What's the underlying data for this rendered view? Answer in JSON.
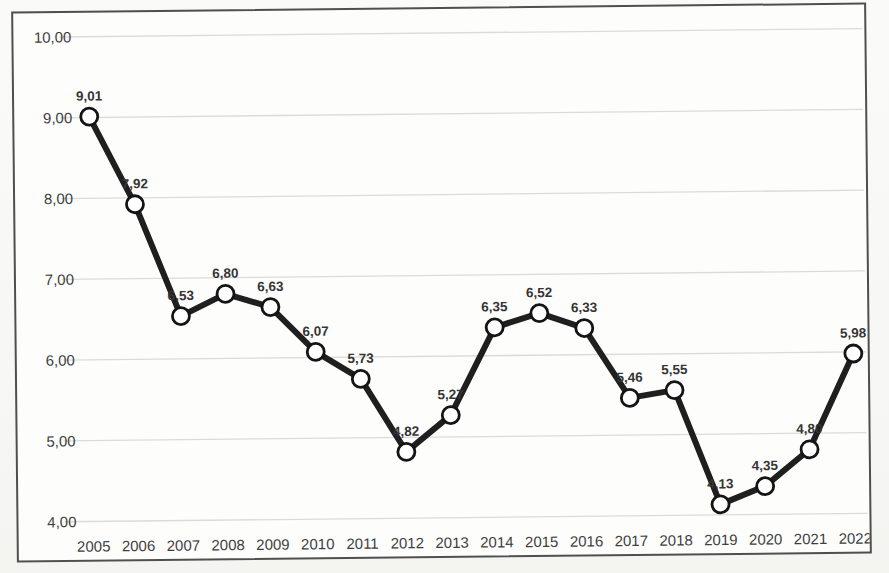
{
  "page": {
    "background": "#f8f8f6"
  },
  "chart_data": {
    "type": "line",
    "title": "",
    "xlabel": "",
    "ylabel": "",
    "legend": "none",
    "grid": "horizontal",
    "ylim": [
      4,
      10
    ],
    "categories": [
      "2005",
      "2006",
      "2007",
      "2008",
      "2009",
      "2010",
      "2011",
      "2012",
      "2013",
      "2014",
      "2015",
      "2016",
      "2017",
      "2018",
      "2019",
      "2020",
      "2021",
      "2022"
    ],
    "series": [
      {
        "name": "series-1",
        "values": [
          9.01,
          7.92,
          6.53,
          6.8,
          6.63,
          6.07,
          5.73,
          4.82,
          5.27,
          6.35,
          6.52,
          6.33,
          5.46,
          5.55,
          4.13,
          4.35,
          4.8,
          5.98
        ],
        "value_labels": [
          "9,01",
          "7,92",
          "6,53",
          "6,80",
          "6,63",
          "6,07",
          "5,73",
          "4,82",
          "5,27",
          "6,35",
          "6,52",
          "6,33",
          "5,46",
          "5,55",
          "4,13",
          "4,35",
          "4,80",
          "5,98"
        ]
      }
    ],
    "y_ticks": [
      {
        "value": 10,
        "label": "10,00"
      },
      {
        "value": 9,
        "label": "9,00"
      },
      {
        "value": 8,
        "label": "8,00"
      },
      {
        "value": 7,
        "label": "7,00"
      },
      {
        "value": 6,
        "label": "6,00"
      },
      {
        "value": 5,
        "label": "5,00"
      },
      {
        "value": 4,
        "label": "4,00"
      }
    ],
    "style": {
      "line_color": "#1f1f1f",
      "marker_fill": "#ffffff",
      "marker_stroke": "#141414",
      "grid_color": "#dbdbd8",
      "border_color": "#4f4f4f",
      "tick_color": "#3f3f3f",
      "data_label_color": "#353535",
      "frame_fill": "#fdfdfc"
    }
  }
}
